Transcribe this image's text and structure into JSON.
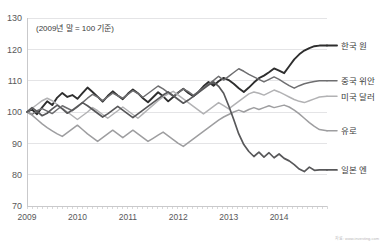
{
  "chart_data": {
    "type": "line",
    "title": "",
    "subtitle": "",
    "annotation": "(2009년 말 = 100 기준)",
    "source": "자료: www.investing.com",
    "xlabel": "",
    "ylabel": "",
    "grid": true,
    "legend_position": "right-inline",
    "ylim": [
      70,
      130
    ],
    "yticks": [
      70,
      80,
      90,
      100,
      110,
      120,
      130
    ],
    "xlim": [
      2009.0,
      2014.95
    ],
    "xticks": [
      2009,
      2010,
      2011,
      2012,
      2013,
      2014
    ],
    "xtick_labels": [
      "2009",
      "2010",
      "2011",
      "2012",
      "2013",
      "2014"
    ],
    "x": [
      2009.0,
      2009.1,
      2009.2,
      2009.3,
      2009.4,
      2009.5,
      2009.6,
      2009.7,
      2009.8,
      2009.9,
      2010.0,
      2010.1,
      2010.2,
      2010.3,
      2010.4,
      2010.5,
      2010.6,
      2010.7,
      2010.8,
      2010.9,
      2011.0,
      2011.1,
      2011.2,
      2011.3,
      2011.4,
      2011.5,
      2011.6,
      2011.7,
      2011.8,
      2011.9,
      2012.0,
      2012.1,
      2012.2,
      2012.3,
      2012.4,
      2012.5,
      2012.6,
      2012.7,
      2012.8,
      2012.9,
      2013.0,
      2013.1,
      2013.2,
      2013.3,
      2013.4,
      2013.5,
      2013.6,
      2013.7,
      2013.8,
      2013.9,
      2014.0,
      2014.1,
      2014.2,
      2014.3,
      2014.4,
      2014.5,
      2014.6,
      2014.7,
      2014.8,
      2014.95
    ],
    "series": [
      {
        "name": "한국 원",
        "label": "한국 원",
        "color": "#2e2e2e",
        "width": 1.9,
        "end_value": 121.2,
        "values": [
          100.0,
          100.8,
          99.3,
          101.5,
          103.4,
          102.2,
          104.6,
          106.1,
          104.8,
          105.4,
          104.2,
          106.0,
          107.8,
          106.4,
          104.9,
          103.3,
          105.1,
          106.6,
          105.3,
          104.1,
          105.8,
          107.2,
          106.0,
          104.4,
          103.1,
          104.7,
          106.3,
          105.0,
          103.4,
          104.8,
          106.2,
          107.4,
          106.1,
          105.0,
          106.4,
          108.2,
          109.6,
          108.4,
          109.8,
          110.9,
          110.2,
          109.0,
          107.6,
          106.4,
          107.8,
          109.4,
          110.8,
          111.6,
          112.7,
          113.9,
          113.2,
          112.4,
          114.6,
          116.8,
          118.4,
          119.6,
          120.4,
          121.0,
          121.2,
          121.2
        ]
      },
      {
        "name": "중국 위안",
        "label": "중국 위안",
        "color": "#6e6e70",
        "width": 1.5,
        "end_value": 110.0,
        "values": [
          100.0,
          99.2,
          100.4,
          101.1,
          100.3,
          99.5,
          100.8,
          102.0,
          101.2,
          100.4,
          101.6,
          103.0,
          104.4,
          105.6,
          104.8,
          103.6,
          104.8,
          106.0,
          105.2,
          104.4,
          105.6,
          106.8,
          105.9,
          104.7,
          105.9,
          107.1,
          108.3,
          107.4,
          106.2,
          105.0,
          106.2,
          107.4,
          106.5,
          105.3,
          106.5,
          107.7,
          108.9,
          110.1,
          111.4,
          110.2,
          111.4,
          112.6,
          113.8,
          113.0,
          112.0,
          111.2,
          110.4,
          109.6,
          110.4,
          111.2,
          110.4,
          109.4,
          108.4,
          107.6,
          108.4,
          109.0,
          109.4,
          109.7,
          110.0,
          110.0
        ]
      },
      {
        "name": "미국 달러",
        "label": "미국 달러",
        "color": "#b2b2b4",
        "width": 1.5,
        "end_value": 105.0,
        "values": [
          100.0,
          101.2,
          102.4,
          103.6,
          104.4,
          103.6,
          102.4,
          101.2,
          100.0,
          98.8,
          97.6,
          98.8,
          100.0,
          101.4,
          100.4,
          99.2,
          98.0,
          99.2,
          100.4,
          101.6,
          100.4,
          99.2,
          98.0,
          99.4,
          100.8,
          102.2,
          103.6,
          104.8,
          105.8,
          106.6,
          105.4,
          104.2,
          103.0,
          101.8,
          100.6,
          99.4,
          100.6,
          101.8,
          103.0,
          102.0,
          101.0,
          102.2,
          103.4,
          104.6,
          105.8,
          106.4,
          106.0,
          105.4,
          106.2,
          107.0,
          106.4,
          105.6,
          104.8,
          104.0,
          103.4,
          103.0,
          103.6,
          104.2,
          104.8,
          105.0
        ]
      },
      {
        "name": "유로",
        "label": "유로",
        "color": "#9e9ea0",
        "width": 1.5,
        "end_value": 94.0,
        "values": [
          100.0,
          99.0,
          97.6,
          96.2,
          95.0,
          94.0,
          93.0,
          92.2,
          93.4,
          94.6,
          95.8,
          94.4,
          93.0,
          91.8,
          90.6,
          91.8,
          93.0,
          94.2,
          93.0,
          91.8,
          93.0,
          94.2,
          93.0,
          91.8,
          90.6,
          91.6,
          92.6,
          93.6,
          92.4,
          91.2,
          90.0,
          89.0,
          90.2,
          91.4,
          92.6,
          93.8,
          95.0,
          96.2,
          97.4,
          98.4,
          99.2,
          100.0,
          100.6,
          100.0,
          100.8,
          101.4,
          100.8,
          101.4,
          102.0,
          101.4,
          101.8,
          102.2,
          101.6,
          100.6,
          99.4,
          98.0,
          96.6,
          95.4,
          94.4,
          94.0
        ]
      },
      {
        "name": "일본 엔",
        "label": "일본 엔",
        "color": "#58585a",
        "width": 1.7,
        "end_value": 81.5,
        "values": [
          100.0,
          101.4,
          100.2,
          98.8,
          99.6,
          101.0,
          102.2,
          101.0,
          99.6,
          100.6,
          101.8,
          103.0,
          102.0,
          100.8,
          99.6,
          98.4,
          99.4,
          100.6,
          101.8,
          100.6,
          99.4,
          98.2,
          99.4,
          100.6,
          101.8,
          103.0,
          104.2,
          105.4,
          106.4,
          105.2,
          104.0,
          102.8,
          103.8,
          105.0,
          106.2,
          107.4,
          108.6,
          109.6,
          108.2,
          106.0,
          102.0,
          97.6,
          93.0,
          89.6,
          87.4,
          85.8,
          87.2,
          85.6,
          87.0,
          85.4,
          86.6,
          85.2,
          84.4,
          83.2,
          81.8,
          81.0,
          82.4,
          81.4,
          81.5,
          81.5
        ]
      }
    ]
  }
}
